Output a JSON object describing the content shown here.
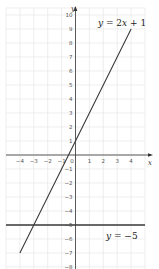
{
  "chart_data": {
    "type": "line",
    "title": "",
    "xlabel": "x",
    "ylabel": "y",
    "xlim": [
      -5,
      5
    ],
    "ylim": [
      -8.5,
      10.5
    ],
    "grid": true,
    "x_ticks": [
      -4,
      -3,
      -2,
      -1,
      0,
      1,
      2,
      3,
      4
    ],
    "y_ticks": [
      10,
      9,
      8,
      7,
      6,
      5,
      4,
      3,
      2,
      1,
      -1,
      -2,
      -3,
      -4,
      -5,
      -6,
      -7,
      -8
    ],
    "series": [
      {
        "name": "y = 2x + 1",
        "equation": "y = 2x + 1",
        "x": [
          -4,
          -3,
          -2,
          -1,
          0,
          1,
          2,
          3,
          4
        ],
        "values": [
          -7,
          -5,
          -3,
          -1,
          1,
          3,
          5,
          7,
          9
        ]
      },
      {
        "name": "y = −5",
        "equation": "y = -5",
        "x": [
          -5,
          5
        ],
        "values": [
          -5,
          -5
        ]
      }
    ],
    "annotations": [
      {
        "text": "y = 2x + 1",
        "x": 2.6,
        "y": 9.6
      },
      {
        "text": "y = −5",
        "x": 2.2,
        "y": -5.9
      }
    ],
    "intersection": {
      "x": -3,
      "y": -5
    }
  },
  "labels": {
    "x_axis": "x",
    "y_axis": "y",
    "line1_prefix": "y",
    "line1_rest": " = 2",
    "line1_var": "x",
    "line1_tail": " + 1",
    "line2_prefix": "y",
    "line2_rest": " = −5"
  },
  "colors": {
    "grid": "#e6e6e6",
    "axis": "#333333",
    "line": "#3a3a3a",
    "background": "#ffffff"
  }
}
